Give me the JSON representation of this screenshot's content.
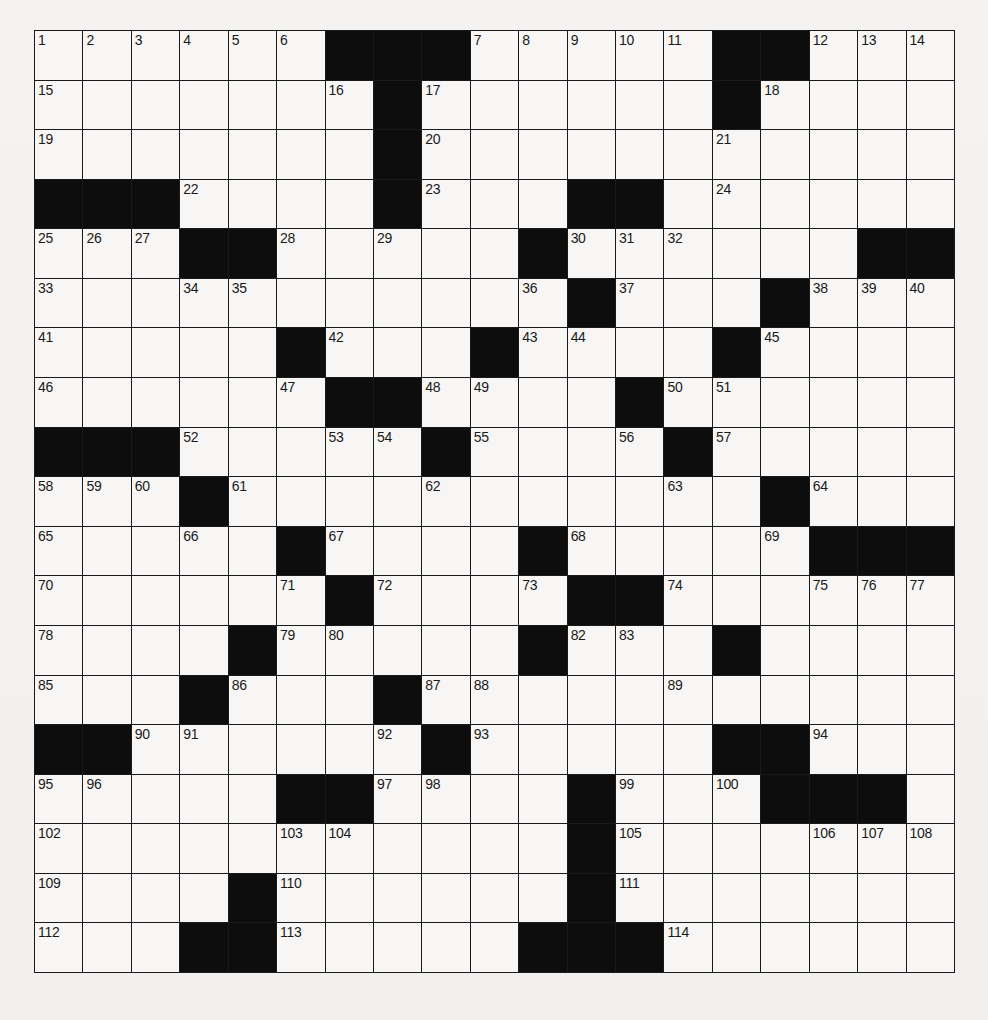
{
  "puzzle": {
    "type": "crossword",
    "size": {
      "rows": 19,
      "cols": 19
    },
    "grid_rows": [
      "......###.....##...",
      ".......#......#....",
      ".......#...........",
      "###....#...##......",
      "...##.....#......##",
      "...........#...#...",
      ".....#...#....#....",
      "......##....#......",
      "###.....#....#.....",
      "...#...........#...",
      ".....#....#.....###",
      "......#....##......",
      "....#.....#...#....",
      "...#...#...........",
      "##......#.....##...",
      ".....##....#...###.",
      "...........#.......",
      "....#......#.......",
      "...##.....###......"
    ],
    "numbers": [
      {
        "r": 0,
        "c": 0,
        "n": "1"
      },
      {
        "r": 0,
        "c": 1,
        "n": "2"
      },
      {
        "r": 0,
        "c": 2,
        "n": "3"
      },
      {
        "r": 0,
        "c": 3,
        "n": "4"
      },
      {
        "r": 0,
        "c": 4,
        "n": "5"
      },
      {
        "r": 0,
        "c": 5,
        "n": "6"
      },
      {
        "r": 0,
        "c": 9,
        "n": "7"
      },
      {
        "r": 0,
        "c": 10,
        "n": "8"
      },
      {
        "r": 0,
        "c": 11,
        "n": "9"
      },
      {
        "r": 0,
        "c": 12,
        "n": "10"
      },
      {
        "r": 0,
        "c": 13,
        "n": "11"
      },
      {
        "r": 0,
        "c": 16,
        "n": "12"
      },
      {
        "r": 0,
        "c": 17,
        "n": "13"
      },
      {
        "r": 0,
        "c": 18,
        "n": "14"
      },
      {
        "r": 1,
        "c": 0,
        "n": "15"
      },
      {
        "r": 1,
        "c": 6,
        "n": "16"
      },
      {
        "r": 1,
        "c": 8,
        "n": "17"
      },
      {
        "r": 1,
        "c": 15,
        "n": "18"
      },
      {
        "r": 2,
        "c": 0,
        "n": "19"
      },
      {
        "r": 2,
        "c": 8,
        "n": "20"
      },
      {
        "r": 2,
        "c": 14,
        "n": "21"
      },
      {
        "r": 3,
        "c": 3,
        "n": "22"
      },
      {
        "r": 3,
        "c": 8,
        "n": "23"
      },
      {
        "r": 3,
        "c": 14,
        "n": "24"
      },
      {
        "r": 4,
        "c": 0,
        "n": "25"
      },
      {
        "r": 4,
        "c": 1,
        "n": "26"
      },
      {
        "r": 4,
        "c": 2,
        "n": "27"
      },
      {
        "r": 4,
        "c": 5,
        "n": "28"
      },
      {
        "r": 4,
        "c": 7,
        "n": "29"
      },
      {
        "r": 4,
        "c": 11,
        "n": "30"
      },
      {
        "r": 4,
        "c": 12,
        "n": "31"
      },
      {
        "r": 4,
        "c": 13,
        "n": "32"
      },
      {
        "r": 5,
        "c": 0,
        "n": "33"
      },
      {
        "r": 5,
        "c": 3,
        "n": "34"
      },
      {
        "r": 5,
        "c": 4,
        "n": "35"
      },
      {
        "r": 5,
        "c": 10,
        "n": "36"
      },
      {
        "r": 5,
        "c": 12,
        "n": "37"
      },
      {
        "r": 5,
        "c": 16,
        "n": "38"
      },
      {
        "r": 5,
        "c": 17,
        "n": "39"
      },
      {
        "r": 5,
        "c": 18,
        "n": "40"
      },
      {
        "r": 6,
        "c": 0,
        "n": "41"
      },
      {
        "r": 6,
        "c": 6,
        "n": "42"
      },
      {
        "r": 6,
        "c": 10,
        "n": "43"
      },
      {
        "r": 6,
        "c": 11,
        "n": "44"
      },
      {
        "r": 6,
        "c": 15,
        "n": "45"
      },
      {
        "r": 7,
        "c": 0,
        "n": "46"
      },
      {
        "r": 7,
        "c": 5,
        "n": "47"
      },
      {
        "r": 7,
        "c": 8,
        "n": "48"
      },
      {
        "r": 7,
        "c": 9,
        "n": "49"
      },
      {
        "r": 7,
        "c": 13,
        "n": "50"
      },
      {
        "r": 7,
        "c": 14,
        "n": "51"
      },
      {
        "r": 8,
        "c": 3,
        "n": "52"
      },
      {
        "r": 8,
        "c": 6,
        "n": "53"
      },
      {
        "r": 8,
        "c": 7,
        "n": "54"
      },
      {
        "r": 8,
        "c": 9,
        "n": "55"
      },
      {
        "r": 8,
        "c": 12,
        "n": "56"
      },
      {
        "r": 8,
        "c": 14,
        "n": "57"
      },
      {
        "r": 9,
        "c": 0,
        "n": "58"
      },
      {
        "r": 9,
        "c": 1,
        "n": "59"
      },
      {
        "r": 9,
        "c": 2,
        "n": "60"
      },
      {
        "r": 9,
        "c": 4,
        "n": "61"
      },
      {
        "r": 9,
        "c": 8,
        "n": "62"
      },
      {
        "r": 9,
        "c": 13,
        "n": "63"
      },
      {
        "r": 9,
        "c": 16,
        "n": "64"
      },
      {
        "r": 10,
        "c": 0,
        "n": "65"
      },
      {
        "r": 10,
        "c": 3,
        "n": "66"
      },
      {
        "r": 10,
        "c": 6,
        "n": "67"
      },
      {
        "r": 10,
        "c": 11,
        "n": "68"
      },
      {
        "r": 10,
        "c": 15,
        "n": "69"
      },
      {
        "r": 11,
        "c": 0,
        "n": "70"
      },
      {
        "r": 11,
        "c": 5,
        "n": "71"
      },
      {
        "r": 11,
        "c": 7,
        "n": "72"
      },
      {
        "r": 11,
        "c": 10,
        "n": "73"
      },
      {
        "r": 11,
        "c": 13,
        "n": "74"
      },
      {
        "r": 11,
        "c": 16,
        "n": "75"
      },
      {
        "r": 11,
        "c": 17,
        "n": "76"
      },
      {
        "r": 11,
        "c": 18,
        "n": "77"
      },
      {
        "r": 12,
        "c": 0,
        "n": "78"
      },
      {
        "r": 12,
        "c": 5,
        "n": "79"
      },
      {
        "r": 12,
        "c": 6,
        "n": "80"
      },
      {
        "r": 12,
        "c": 10,
        "n": "81"
      },
      {
        "r": 12,
        "c": 11,
        "n": "82"
      },
      {
        "r": 12,
        "c": 12,
        "n": "83"
      },
      {
        "r": 12,
        "c": 14,
        "n": "84"
      },
      {
        "r": 13,
        "c": 0,
        "n": "85"
      },
      {
        "r": 13,
        "c": 4,
        "n": "86"
      },
      {
        "r": 13,
        "c": 8,
        "n": "87"
      },
      {
        "r": 13,
        "c": 9,
        "n": "88"
      },
      {
        "r": 13,
        "c": 13,
        "n": "89"
      },
      {
        "r": 14,
        "c": 2,
        "n": "90"
      },
      {
        "r": 14,
        "c": 3,
        "n": "91"
      },
      {
        "r": 14,
        "c": 7,
        "n": "92"
      },
      {
        "r": 14,
        "c": 9,
        "n": "93"
      },
      {
        "r": 14,
        "c": 16,
        "n": "94"
      },
      {
        "r": 15,
        "c": 0,
        "n": "95"
      },
      {
        "r": 15,
        "c": 1,
        "n": "96"
      },
      {
        "r": 15,
        "c": 7,
        "n": "97"
      },
      {
        "r": 15,
        "c": 8,
        "n": "98"
      },
      {
        "r": 15,
        "c": 12,
        "n": "99"
      },
      {
        "r": 15,
        "c": 14,
        "n": "100"
      },
      {
        "r": 15,
        "c": 15,
        "n": "101"
      },
      {
        "r": 16,
        "c": 0,
        "n": "102"
      },
      {
        "r": 16,
        "c": 5,
        "n": "103"
      },
      {
        "r": 16,
        "c": 6,
        "n": "104"
      },
      {
        "r": 16,
        "c": 12,
        "n": "105"
      },
      {
        "r": 16,
        "c": 16,
        "n": "106"
      },
      {
        "r": 16,
        "c": 17,
        "n": "107"
      },
      {
        "r": 16,
        "c": 18,
        "n": "108"
      },
      {
        "r": 17,
        "c": 0,
        "n": "109"
      },
      {
        "r": 17,
        "c": 5,
        "n": "110"
      },
      {
        "r": 17,
        "c": 12,
        "n": "111"
      },
      {
        "r": 18,
        "c": 0,
        "n": "112"
      },
      {
        "r": 18,
        "c": 5,
        "n": "113"
      },
      {
        "r": 18,
        "c": 13,
        "n": "114"
      }
    ],
    "colors": {
      "black_square": "#0d0d0d",
      "white_square": "#f7f6f4",
      "grid_line": "#1a1a1a",
      "paper": "#f3f2f0"
    }
  }
}
